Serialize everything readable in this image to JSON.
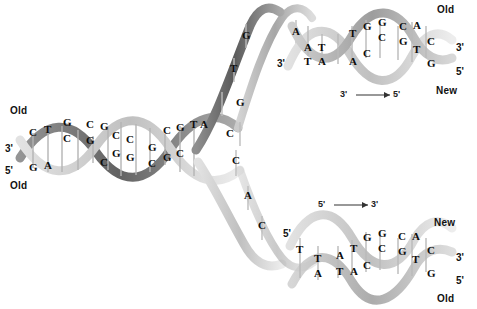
{
  "figure": {
    "colors": {
      "dark_strand": "#6f6f6f",
      "light_strand": "#c9c9c9",
      "mid_strand": "#9a9a9a",
      "base_text": "#0c0c0c",
      "bond": "#8a8a8a",
      "background": "#ffffff"
    }
  },
  "labels": {
    "old_top_left": "Old",
    "old_bottom_left": "Old",
    "old_top_right": "Old",
    "new_top_right": "New",
    "new_bottom_right": "New",
    "old_bottom_right": "Old"
  },
  "primes": {
    "parent_three": "3'",
    "parent_five": "5'",
    "fork_top_three": "3'",
    "fork_bottom_five": "5'",
    "top_right_three": "3'",
    "top_right_five": "5'",
    "bottom_right_three": "3'",
    "bottom_right_five": "5'",
    "top_left_of_top_helix": "3'",
    "bottom_left_of_bottom_helix": "5'"
  },
  "arrows": {
    "top": {
      "from": "3'",
      "to": "5'",
      "glyph": "⟶"
    },
    "bottom": {
      "from": "5'",
      "to": "3'",
      "glyph": "⟶"
    }
  },
  "parental_duplex": {
    "name": "parental-double-helix",
    "pairs": [
      {
        "top": "C",
        "bottom": "G",
        "bonds": 3
      },
      {
        "top": "T",
        "bottom": "A",
        "bonds": 2
      },
      {
        "top": "G",
        "bottom": "C",
        "bonds": 3
      },
      {
        "top": "C",
        "bottom": "G",
        "bonds": 3
      },
      {
        "top": "G",
        "bottom": "C",
        "bonds": 3
      },
      {
        "top": "C",
        "bottom": "G",
        "bonds": 3
      },
      {
        "top": "C",
        "bottom": "G",
        "bonds": 3
      },
      {
        "top": "G",
        "bottom": "C",
        "bonds": 3
      },
      {
        "top": "C",
        "bottom": "G",
        "bonds": 3
      },
      {
        "top": "G",
        "bottom": "C",
        "bonds": 3
      },
      {
        "top": "T",
        "bottom": "A",
        "bonds": 2
      }
    ]
  },
  "fork": {
    "leading_template_bases": [
      "G",
      "T",
      "G",
      "C"
    ],
    "lagging_template_bases": [
      "C",
      "A",
      "C"
    ],
    "unpaired_top_light": [
      "A"
    ]
  },
  "daughter_top": {
    "name": "top-daughter-helix",
    "pairs": [
      {
        "top": "A",
        "bottom": "T",
        "bonds": 2
      },
      {
        "top": "A",
        "bottom": "T",
        "bonds": 2
      },
      {
        "top": "T",
        "bottom": "A",
        "bonds": 3
      },
      {
        "top": "G",
        "bottom": "C",
        "bonds": 3
      },
      {
        "top": "G",
        "bottom": "C",
        "bonds": 2
      },
      {
        "top": "C",
        "bottom": "G",
        "bonds": 2
      },
      {
        "top": "A",
        "bottom": "T",
        "bonds": 2
      },
      {
        "top": "C",
        "bottom": "G",
        "bonds": 3
      }
    ]
  },
  "daughter_bottom": {
    "name": "bottom-daughter-helix",
    "pairs": [
      {
        "top": "T",
        "bottom": "A",
        "bonds": 2
      },
      {
        "top": "A",
        "bottom": "T",
        "bonds": 2
      },
      {
        "top": "T",
        "bottom": "A",
        "bonds": 3
      },
      {
        "top": "G",
        "bottom": "C",
        "bonds": 3
      },
      {
        "top": "G",
        "bottom": "C",
        "bonds": 2
      },
      {
        "top": "C",
        "bottom": "G",
        "bonds": 2
      },
      {
        "top": "A",
        "bottom": "T",
        "bonds": 2
      },
      {
        "top": "C",
        "bottom": "G",
        "bonds": 3
      }
    ]
  },
  "loose_bases": {
    "top_strand_T": "T",
    "bottom_strand_T": "T"
  }
}
